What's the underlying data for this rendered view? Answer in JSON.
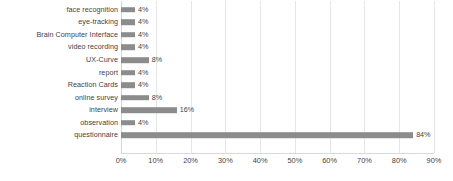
{
  "chart_data": {
    "type": "bar",
    "orientation": "horizontal",
    "title": "",
    "subtitle": "",
    "xlabel": "",
    "ylabel": "",
    "xlim": [
      0,
      90
    ],
    "grid": true,
    "legend": false,
    "value_suffix": "%",
    "categories": [
      "face recognition",
      "eye-tracking",
      "Brain Computer Interface",
      "video recording",
      "UX-Curve",
      "report",
      "Reaction Cards",
      "online survey",
      "interview",
      "observation",
      "questionnaire"
    ],
    "values": [
      4,
      4,
      4,
      4,
      8,
      4,
      4,
      8,
      16,
      4,
      84
    ],
    "value_labels": [
      "4%",
      "4%",
      "4%",
      "4%",
      "8%",
      "4%",
      "4%",
      "8%",
      "16%",
      "4%",
      "84%"
    ],
    "x_ticks": [
      0,
      10,
      20,
      30,
      40,
      50,
      60,
      70,
      80,
      90
    ],
    "x_tick_labels": [
      "0%",
      "10%",
      "20%",
      "30%",
      "40%",
      "50%",
      "60%",
      "70%",
      "80%",
      "90%"
    ],
    "colors": {
      "bar": "#8c8c8c",
      "gridline": "#e6e6e6",
      "axis": "#d9d9d9",
      "text": "#3f3f3f",
      "background": "#ffffff"
    }
  }
}
